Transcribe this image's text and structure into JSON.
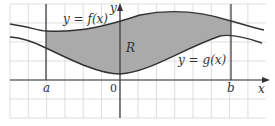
{
  "diagram": {
    "type": "area-between-curves",
    "upper_curve_label": "y = f(x)",
    "lower_curve_label": "y = g(x)",
    "region_label": "R",
    "x_axis_label": "x",
    "y_axis_label": "y",
    "left_bound_label": "a",
    "right_bound_label": "b",
    "origin_label": "0",
    "colors": {
      "region_fill": "#aaaaaa",
      "curve": "#333333",
      "grid": "#d0d0d0",
      "axis": "#333333"
    }
  }
}
